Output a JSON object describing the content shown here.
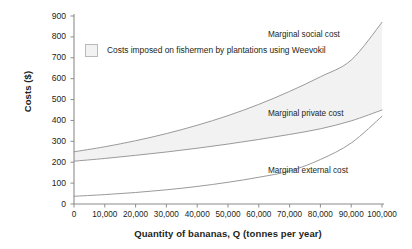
{
  "chart_data": {
    "type": "line",
    "title": "",
    "xlabel": "Quantity of bananas, Q (tonnes per year)",
    "ylabel": "Costs ($)",
    "xlim": [
      0,
      100000
    ],
    "ylim": [
      0,
      900
    ],
    "grid": false,
    "legend_position": "upper-left-inside",
    "x": [
      0,
      10000,
      20000,
      30000,
      40000,
      50000,
      60000,
      70000,
      80000,
      90000,
      100000
    ],
    "series": [
      {
        "name": "Marginal social cost",
        "values": [
          250,
          274,
          303,
          337,
          377,
          423,
          477,
          539,
          609,
          689,
          870
        ]
      },
      {
        "name": "Marginal private cost",
        "values": [
          205,
          218,
          233,
          249,
          267,
          287,
          309,
          333,
          360,
          398,
          450
        ]
      },
      {
        "name": "Marginal external cost",
        "values": [
          37,
          45,
          55,
          68,
          84,
          104,
          128,
          158,
          213,
          292,
          420
        ]
      }
    ],
    "shaded_region": {
      "label": "Costs imposed on fishermen by plantations using Weevokil",
      "between": [
        "Marginal private cost",
        "Marginal social cost"
      ],
      "fill": "#f2f2f2"
    },
    "annotations": [
      {
        "text": "Marginal social cost",
        "x": 74000,
        "y": 810
      },
      {
        "text": "Marginal private cost",
        "x": 74000,
        "y": 430
      },
      {
        "text": "Marginal external cost",
        "x": 74000,
        "y": 160
      }
    ],
    "yticks": [
      0,
      100,
      200,
      300,
      400,
      500,
      600,
      700,
      800,
      900
    ],
    "ytick_labels": [
      "0",
      "100",
      "200",
      "300",
      "400",
      "500",
      "600",
      "700",
      "800",
      "900"
    ],
    "xticks": [
      0,
      10000,
      20000,
      30000,
      40000,
      50000,
      60000,
      70000,
      80000,
      90000,
      100000
    ],
    "xtick_labels": [
      "0",
      "10,000",
      "20,000",
      "30,000",
      "40,000",
      "50,000",
      "60,000",
      "70,000",
      "80,000",
      "90,000",
      "100,000"
    ],
    "colors": {
      "axis": "#8c8c8c",
      "curve": "#9a9a9a",
      "fill": "#f2f2f2",
      "text": "#231f20"
    }
  },
  "legend": {
    "swatch_name": "shaded-area-swatch",
    "label": "Costs imposed on fishermen by plantations using Weevokil"
  },
  "labels": {
    "y_axis_title": "Costs ($)",
    "x_axis_title": "Quantity of bananas, Q (tonnes per year)",
    "curve_msc": "Marginal social cost",
    "curve_mpc": "Marginal private cost",
    "curve_mec": "Marginal external cost"
  }
}
